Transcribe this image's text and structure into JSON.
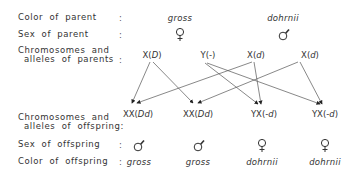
{
  "rows": {
    "parent_color_label": "Color of parent",
    "parent_sex_label": "Sex of parent",
    "parent_chrom_label_1": "Chromosomes and",
    "parent_chrom_label_2": "alleles of parents",
    "offspring_chrom_label_1": "Chromosomes and",
    "offspring_chrom_label_2": "alleles of offspring:",
    "offspring_sex_label": "Sex of offspring",
    "offspring_color_label": "Color of offspring",
    "colon": ":"
  },
  "parents": [
    {
      "color": "gross",
      "sex": "female",
      "chromosomes": [
        "X(D)",
        "Y(-)"
      ]
    },
    {
      "color": "dohrnii",
      "sex": "male",
      "chromosomes": [
        "X(d)",
        "X(d)"
      ]
    }
  ],
  "offspring": [
    {
      "chromosomes": "XX(Dd)",
      "sex": "male",
      "color": "gross"
    },
    {
      "chromosomes": "XX(Dd)",
      "sex": "male",
      "color": "gross"
    },
    {
      "chromosomes": "YX(-d)",
      "sex": "female",
      "color": "dohrnii"
    },
    {
      "chromosomes": "YX(-d)",
      "sex": "female",
      "color": "dohrnii"
    }
  ],
  "inheritance_arrows": [
    {
      "from": "X(D)",
      "to_offspring": 1
    },
    {
      "from": "X(D)",
      "to_offspring": 2
    },
    {
      "from": "Y(-)",
      "to_offspring": 3
    },
    {
      "from": "Y(-)",
      "to_offspring": 4
    },
    {
      "from": "X(d) #1",
      "to_offspring": 1
    },
    {
      "from": "X(d) #1",
      "to_offspring": 3
    },
    {
      "from": "X(d) #2",
      "to_offspring": 2
    },
    {
      "from": "X(d) #2",
      "to_offspring": 4
    }
  ],
  "symbols": {
    "female": "♀",
    "male": "♂"
  }
}
